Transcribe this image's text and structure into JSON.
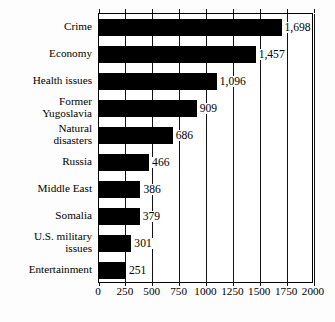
{
  "chart_data": {
    "type": "bar",
    "orientation": "horizontal",
    "title": "",
    "subtitle": "",
    "xlabel": "",
    "ylabel": "",
    "categories": [
      "Crime",
      "Economy",
      "Health issues",
      "Former\nYugoslavia",
      "Natural\ndisasters",
      "Russia",
      "Middle East",
      "Somalia",
      "U.S. military\nissues",
      "Entertainment"
    ],
    "values": [
      1698,
      1457,
      1096,
      909,
      686,
      466,
      386,
      379,
      301,
      251
    ],
    "value_labels": [
      "1,698",
      "1,457",
      "1,096",
      "909",
      "686",
      "466",
      "386",
      "379",
      "301",
      "251"
    ],
    "xlim": [
      0,
      2000
    ],
    "xticks": [
      0,
      250,
      500,
      750,
      1000,
      1250,
      1500,
      1750,
      2000
    ],
    "xtick_labels": [
      "0",
      "250",
      "500",
      "750",
      "1000",
      "1250",
      "1500",
      "1750",
      "2000"
    ],
    "grid": true,
    "grid_axis": "x",
    "legend": false,
    "legend_position": "none",
    "bar_color": "#000000",
    "plot_background": "#ffffff",
    "axis_color": "#000000"
  }
}
